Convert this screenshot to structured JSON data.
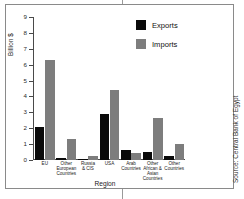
{
  "chart_data": {
    "type": "bar",
    "title": "",
    "xlabel": "Region",
    "ylabel": "Billion $",
    "ylim": [
      0,
      9
    ],
    "yticks": [
      0,
      1,
      2,
      3,
      4,
      5,
      6,
      7,
      8,
      9
    ],
    "ytick_labels": [
      "0",
      "1",
      "2",
      "3",
      "4",
      "5",
      "6",
      "7",
      "8",
      "9"
    ],
    "grid": false,
    "legend_position": "top-right",
    "categories": [
      "EU",
      "Other European Countries",
      "Russia & CIS",
      "USA",
      "Arab Countries",
      "Other African & Asian Countries",
      "Other Countries"
    ],
    "category_lines": [
      [
        "EU"
      ],
      [
        "Other",
        "European",
        "Countries"
      ],
      [
        "Russia",
        "& CIS"
      ],
      [
        "USA"
      ],
      [
        "Arab",
        "Countries"
      ],
      [
        "Other",
        "African &",
        "Asian",
        "Countries"
      ],
      [
        "Other",
        "Countries"
      ]
    ],
    "series": [
      {
        "name": "Exports",
        "color": "#0a0a0a",
        "values": [
          2.1,
          0.15,
          0.05,
          2.9,
          0.6,
          0.5,
          0.25
        ]
      },
      {
        "name": "Imports",
        "color": "#7d7d7d",
        "values": [
          6.3,
          1.35,
          0.25,
          4.4,
          0.45,
          2.65,
          1.0
        ]
      }
    ]
  },
  "legend": {
    "items": [
      {
        "label": "Exports",
        "color": "#0a0a0a"
      },
      {
        "label": "Imports",
        "color": "#7d7d7d"
      }
    ]
  },
  "source_note": "Source: Central Bank of Egypt"
}
